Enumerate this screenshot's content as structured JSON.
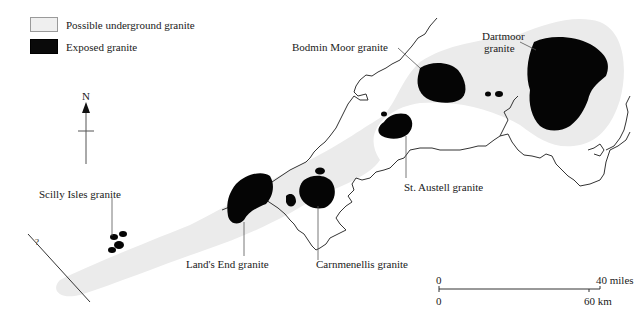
{
  "legend": {
    "items": [
      {
        "label": "Possible underground granite",
        "color": "#efefef"
      },
      {
        "label": "Exposed granite",
        "color": "#0a0a0a"
      }
    ]
  },
  "north_arrow": {
    "label": "N"
  },
  "granites": {
    "bodmin": "Bodmin Moor granite",
    "dartmoor_line1": "Dartmoor",
    "dartmoor_line2": "granite",
    "st_austell": "St. Austell granite",
    "scilly": "Scilly Isles granite",
    "lands_end": "Land's End granite",
    "carnmenellis": "Carnmenellis granite"
  },
  "fault_marker": "?",
  "scale_bar": {
    "miles_start": "0",
    "miles_end": "40 miles",
    "km_start": "0",
    "km_end": "60 km"
  },
  "colors": {
    "underground": "#e9e9e9",
    "exposed": "#050505",
    "coastline": "#333333"
  }
}
